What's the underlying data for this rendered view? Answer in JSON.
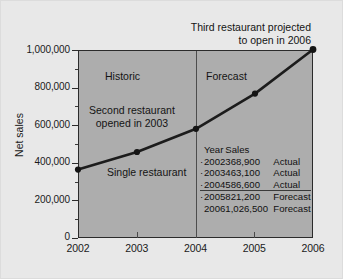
{
  "chart_data": {
    "type": "line",
    "title": "",
    "xlabel": "",
    "ylabel": "Net sales",
    "categories": [
      "2002",
      "2003",
      "2004",
      "2005",
      "2006"
    ],
    "x": [
      2002,
      2003,
      2004,
      2005,
      2006
    ],
    "values": [
      368900,
      463100,
      586600,
      821200,
      1026500
    ],
    "series": [
      {
        "name": "Net sales",
        "values": [
          368900,
          463100,
          586600,
          821200,
          1026500
        ]
      }
    ],
    "ylim": [
      0,
      1000000
    ],
    "xlim": [
      2002,
      2006
    ],
    "ytick_labels": [
      "0",
      "200,000",
      "400,000",
      "600,000",
      "800,000",
      "1,000,000"
    ],
    "ytick_values": [
      0,
      200000,
      400000,
      600000,
      800000,
      1000000
    ],
    "xtick_labels": [
      "2002",
      "2003",
      "2004",
      "2005",
      "2006"
    ],
    "grid": false,
    "legend": "none",
    "annotations": [
      "Third restaurant projected to open in 2006",
      "Historic",
      "Forecast",
      "Second restaurant opened in 2003",
      "Single restaurant"
    ]
  },
  "axes": {
    "ylabel": "Net sales",
    "yticks": [
      {
        "label": "1,000,000",
        "value": 1000000
      },
      {
        "label": "800,000",
        "value": 800000
      },
      {
        "label": "600,000",
        "value": 600000
      },
      {
        "label": "400,000",
        "value": 400000
      },
      {
        "label": "200,000",
        "value": 200000
      },
      {
        "label": "0",
        "value": 0
      }
    ],
    "xticks": [
      {
        "label": "2002"
      },
      {
        "label": "2003"
      },
      {
        "label": "2004"
      },
      {
        "label": "2005"
      },
      {
        "label": "2006"
      }
    ]
  },
  "annotations": {
    "third_restaurant_line1": "Third restaurant projected",
    "third_restaurant_line2": "to open in 2006",
    "historic": "Historic",
    "forecast": "Forecast",
    "second_restaurant_line1": "Second restaurant",
    "second_restaurant_line2": "opened in 2003",
    "single_restaurant": "Single restaurant"
  },
  "inset_table": {
    "headers": {
      "year": "Year",
      "sales": "Sales",
      "status": ""
    },
    "rows": [
      {
        "bullet": "·",
        "year": "2002",
        "sales": "368,900",
        "status": "Actual",
        "ruled": false
      },
      {
        "bullet": "·",
        "year": "2003",
        "sales": "463,100",
        "status": "Actual",
        "ruled": false
      },
      {
        "bullet": "·",
        "year": "2004",
        "sales": "586,600",
        "status": "Actual",
        "ruled": false
      },
      {
        "bullet": "·",
        "year": "2005",
        "sales": "821,200",
        "status": "Forecast",
        "ruled": true
      },
      {
        "bullet": "",
        "year": "2006",
        "sales": "1,026,500",
        "status": "Forecast",
        "ruled": false
      }
    ]
  },
  "colors": {
    "figure_background": "#e8e8e8",
    "plot_background": "#adadad",
    "line": "#1c1c1c",
    "text": "#141414",
    "axis": "#2b2b2b"
  }
}
